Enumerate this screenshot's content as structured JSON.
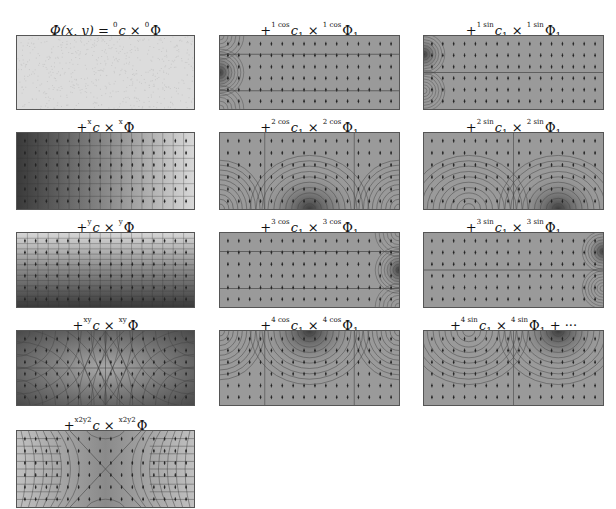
{
  "figure": {
    "panels": [
      {
        "id": "p0",
        "col": 0,
        "row": 0,
        "prefix": "",
        "lhs": "Φ(x, y) = ",
        "coef": "c",
        "coef_sup": "0",
        "coef_sub": "",
        "basis": "Φ",
        "basis_sup": "0",
        "basis_sub": "",
        "suffix": "",
        "pattern": "constant"
      },
      {
        "id": "p1",
        "col": 0,
        "row": 1,
        "prefix": "+",
        "lhs": "",
        "coef": "c",
        "coef_sup": "x",
        "coef_sub": "",
        "basis": "Φ",
        "basis_sup": "x",
        "basis_sub": "",
        "suffix": "",
        "pattern": "gradient-x"
      },
      {
        "id": "p2",
        "col": 0,
        "row": 2,
        "prefix": "+",
        "lhs": "",
        "coef": "c",
        "coef_sup": "y",
        "coef_sub": "",
        "basis": "Φ",
        "basis_sup": "y",
        "basis_sub": "",
        "suffix": "",
        "pattern": "gradient-y"
      },
      {
        "id": "p3",
        "col": 0,
        "row": 3,
        "prefix": "+",
        "lhs": "",
        "coef": "c",
        "coef_sup": "xy",
        "coef_sub": "",
        "basis": "Φ",
        "basis_sup": "xy",
        "basis_sub": "",
        "suffix": "",
        "pattern": "saddle-xy"
      },
      {
        "id": "p4",
        "col": 0,
        "row": 4,
        "prefix": "+",
        "lhs": "",
        "coef": "c",
        "coef_sup": "x2y2",
        "coef_sub": "",
        "basis": "Φ",
        "basis_sup": "x2y2",
        "basis_sub": "",
        "suffix": "",
        "pattern": "saddle-x2y2"
      },
      {
        "id": "p5",
        "col": 1,
        "row": 0,
        "prefix": "+",
        "lhs": "",
        "coef": "c",
        "coef_sup": "1 cos",
        "coef_sub": "1",
        "basis": "Φ",
        "basis_sup": "1 cos",
        "basis_sub": "1",
        "suffix": "",
        "pattern": "left-source"
      },
      {
        "id": "p6",
        "col": 1,
        "row": 1,
        "prefix": "+",
        "lhs": "",
        "coef": "c",
        "coef_sup": "2 cos",
        "coef_sub": "1",
        "basis": "Φ",
        "basis_sup": "2 cos",
        "basis_sub": "1",
        "suffix": "",
        "pattern": "bottom-dome"
      },
      {
        "id": "p7",
        "col": 1,
        "row": 2,
        "prefix": "+",
        "lhs": "",
        "coef": "c",
        "coef_sup": "3 cos",
        "coef_sub": "1",
        "basis": "Φ",
        "basis_sup": "3 cos",
        "basis_sub": "1",
        "suffix": "",
        "pattern": "right-source"
      },
      {
        "id": "p8",
        "col": 1,
        "row": 3,
        "prefix": "+",
        "lhs": "",
        "coef": "c",
        "coef_sup": "4 cos",
        "coef_sub": "1",
        "basis": "Φ",
        "basis_sup": "4 cos",
        "basis_sub": "1",
        "suffix": "",
        "pattern": "top-dome"
      },
      {
        "id": "p9",
        "col": 2,
        "row": 0,
        "prefix": "+",
        "lhs": "",
        "coef": "c",
        "coef_sup": "1 sin",
        "coef_sub": "1",
        "basis": "Φ",
        "basis_sup": "1 sin",
        "basis_sub": "1",
        "suffix": "",
        "pattern": "left-dipole"
      },
      {
        "id": "p10",
        "col": 2,
        "row": 1,
        "prefix": "+",
        "lhs": "",
        "coef": "c",
        "coef_sup": "2 sin",
        "coef_sub": "1",
        "basis": "Φ",
        "basis_sup": "2 sin",
        "basis_sub": "1",
        "suffix": "",
        "pattern": "bottom-dipole"
      },
      {
        "id": "p11",
        "col": 2,
        "row": 2,
        "prefix": "+",
        "lhs": "",
        "coef": "c",
        "coef_sup": "3 sin",
        "coef_sub": "1",
        "basis": "Φ",
        "basis_sup": "3 sin",
        "basis_sub": "1",
        "suffix": "",
        "pattern": "right-dipole"
      },
      {
        "id": "p12",
        "col": 2,
        "row": 3,
        "prefix": "+",
        "lhs": "",
        "coef": "c",
        "coef_sup": "4 sin",
        "coef_sub": "1",
        "basis": "Φ",
        "basis_sup": "4 sin",
        "basis_sub": "1",
        "suffix": " + ···",
        "pattern": "top-dipole"
      }
    ],
    "colors": {
      "background": "#ffffff",
      "panel_fill": "#9a9a9a",
      "panel_light": "#dcdcdc",
      "panel_dark": "#3c3c3c",
      "contour": "#444444",
      "arrow": "#222222"
    }
  }
}
